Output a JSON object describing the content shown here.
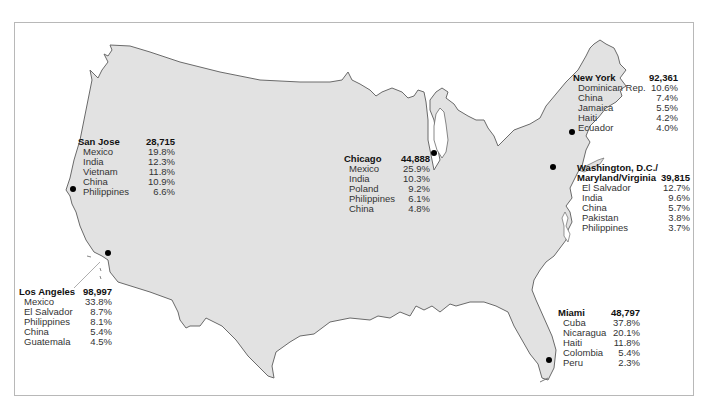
{
  "colors": {
    "land": "#e2e2e2",
    "outline": "#6a6a6a",
    "water": "#ffffff",
    "marker": "#000000"
  },
  "cities": {
    "san_jose": {
      "name": "San Jose",
      "total": "28,715",
      "origins": [
        {
          "country": "Mexico",
          "pct": "19.8%"
        },
        {
          "country": "India",
          "pct": "12.3%"
        },
        {
          "country": "Vietnam",
          "pct": "11.8%"
        },
        {
          "country": "China",
          "pct": "10.9%"
        },
        {
          "country": "Philippines",
          "pct": "6.6%"
        }
      ]
    },
    "los_angeles": {
      "name": "Los Angeles",
      "total": "98,997",
      "origins": [
        {
          "country": "Mexico",
          "pct": "33.8%"
        },
        {
          "country": "El Salvador",
          "pct": "8.7%"
        },
        {
          "country": "Philippines",
          "pct": "8.1%"
        },
        {
          "country": "China",
          "pct": "5.4%"
        },
        {
          "country": "Guatemala",
          "pct": "4.5%"
        }
      ]
    },
    "chicago": {
      "name": "Chicago",
      "total": "44,888",
      "origins": [
        {
          "country": "Mexico",
          "pct": "25.9%"
        },
        {
          "country": "India",
          "pct": "10.3%"
        },
        {
          "country": "Poland",
          "pct": "9.2%"
        },
        {
          "country": "Philippines",
          "pct": "6.1%"
        },
        {
          "country": "China",
          "pct": "4.8%"
        }
      ]
    },
    "new_york": {
      "name": "New York",
      "total": "92,361",
      "origins": [
        {
          "country": "Dominican Rep.",
          "pct": "10.6%"
        },
        {
          "country": "China",
          "pct": "7.4%"
        },
        {
          "country": "Jamaica",
          "pct": "5.5%"
        },
        {
          "country": "Haiti",
          "pct": "4.2%"
        },
        {
          "country": "Ecuador",
          "pct": "4.0%"
        }
      ]
    },
    "washington": {
      "name_line1": "Washington, D.C./",
      "name_line2": "Maryland/Virginia",
      "total": "39,815",
      "origins": [
        {
          "country": "El Salvador",
          "pct": "12.7%"
        },
        {
          "country": "India",
          "pct": "9.6%"
        },
        {
          "country": "China",
          "pct": "5.7%"
        },
        {
          "country": "Pakistan",
          "pct": "3.8%"
        },
        {
          "country": "Philippines",
          "pct": "3.7%"
        }
      ]
    },
    "miami": {
      "name": "Miami",
      "total": "48,797",
      "origins": [
        {
          "country": "Cuba",
          "pct": "37.8%"
        },
        {
          "country": "Nicaragua",
          "pct": "20.1%"
        },
        {
          "country": "Haiti",
          "pct": "11.8%"
        },
        {
          "country": "Colombia",
          "pct": "5.4%"
        },
        {
          "country": "Peru",
          "pct": "2.3%"
        }
      ]
    }
  }
}
